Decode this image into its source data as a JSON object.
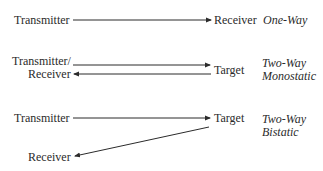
{
  "diagram": {
    "rows": [
      {
        "name": "one-way",
        "source_label": "Transmitter",
        "dest_label": "Receiver",
        "mode_label": [
          "One-Way"
        ]
      },
      {
        "name": "two-way-monostatic",
        "source_label_line1": "Transmitter/",
        "source_label_line2": "Receiver",
        "dest_label": "Target",
        "mode_label": [
          "Two-Way",
          "Monostatic"
        ]
      },
      {
        "name": "two-way-bistatic",
        "source_label": "Transmitter",
        "dest_label": "Target",
        "return_label": "Receiver",
        "mode_label": [
          "Two-Way",
          "Bistatic"
        ]
      }
    ],
    "colors": {
      "text": "#2b2b2b",
      "arrow": "#2b2b2b",
      "background": "#ffffff"
    }
  }
}
